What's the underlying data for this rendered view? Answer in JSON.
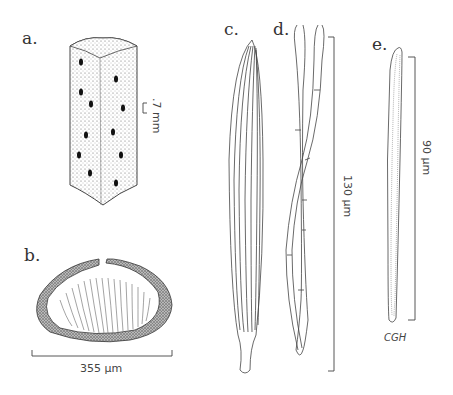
{
  "figure": {
    "panels": [
      {
        "id": "a",
        "label": "a.",
        "subject": "stem-prism",
        "scale": ".7 mm"
      },
      {
        "id": "b",
        "label": "b.",
        "subject": "cross-section",
        "scale": "355 µm"
      },
      {
        "id": "c",
        "label": "c.",
        "subject": "spicule-bundle",
        "scale": ""
      },
      {
        "id": "d",
        "label": "d.",
        "subject": "twisted-fibers",
        "scale": "130 µm"
      },
      {
        "id": "e",
        "label": "e.",
        "subject": "single-fiber",
        "scale": "90 µm"
      }
    ],
    "signature": "CGH",
    "colors": {
      "ink": "#333333",
      "stipple": "#555555",
      "paper": "#ffffff"
    }
  }
}
